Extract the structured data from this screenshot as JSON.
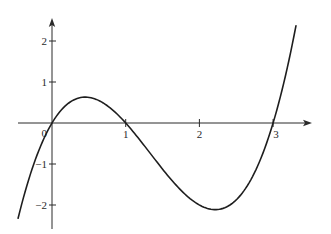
{
  "chart_data": {
    "type": "line",
    "title": "",
    "xlabel": "",
    "ylabel": "",
    "function": "y = x(x-1)(x-3)",
    "coefficients": {
      "a3": 1,
      "a2": -4,
      "a1": 3,
      "a0": 0
    },
    "x_range": [
      -0.46,
      3.31
    ],
    "xlim": [
      -0.45,
      3.55
    ],
    "ylim": [
      -2.55,
      2.55
    ],
    "x_ticks": [
      1,
      2,
      3
    ],
    "x_tick_labels": [
      "1",
      "2",
      "3"
    ],
    "y_ticks": [
      -2,
      -1,
      1,
      2
    ],
    "y_tick_labels": [
      "−2",
      "−1",
      "1",
      "2"
    ],
    "origin_label": "0",
    "grid": false,
    "legend": null,
    "roots": [
      0,
      1,
      3
    ],
    "local_max": {
      "x": 0.45,
      "y": 0.63
    },
    "local_min": {
      "x": 2.22,
      "y": -2.11
    },
    "samples": {
      "x": [
        -0.46,
        -0.25,
        0,
        0.25,
        0.45,
        0.75,
        1,
        1.25,
        1.5,
        1.75,
        2,
        2.22,
        2.5,
        2.75,
        3,
        3.15,
        3.31
      ],
      "y": [
        -2.39,
        -1.02,
        0,
        0.52,
        0.63,
        0.42,
        0,
        -0.55,
        -1.13,
        -1.64,
        -2,
        -2.11,
        -1.88,
        -1.03,
        0,
        0.99,
        2.37
      ]
    },
    "colors": {
      "axis": "#2a2a2a",
      "curve": "#1e1e1e",
      "background": "#ffffff"
    }
  },
  "axes": {
    "origin_px": {
      "x": 52,
      "y": 123
    },
    "px_per_unit": {
      "x": 73.7,
      "y": 41
    },
    "x_axis_px": {
      "start": 18,
      "end": 312
    },
    "y_axis_px": {
      "start": 229,
      "end": 18
    }
  }
}
